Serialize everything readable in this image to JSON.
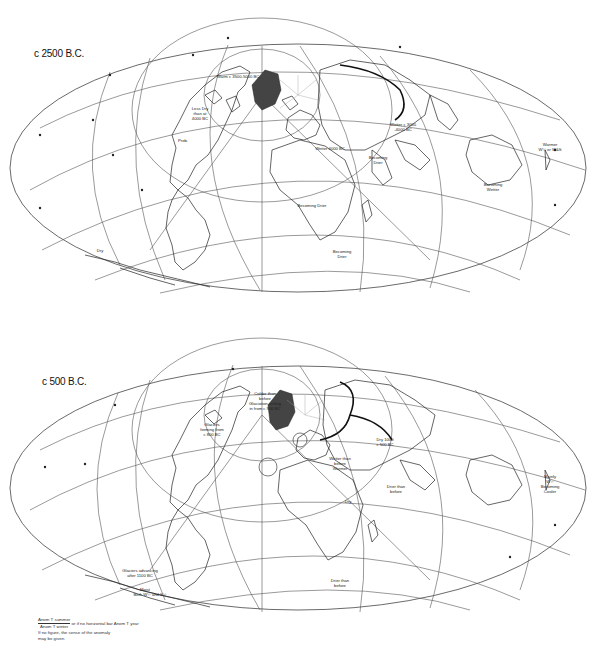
{
  "figure": {
    "type": "paleoclimate anomaly world maps",
    "projection": "oblique equal-area world projection centered on North Pole / Greenland"
  },
  "panels": [
    {
      "title": "c 2500 B.C.",
      "annotations": [
        {
          "text": "Warm c 3500-5000 BC",
          "region": "arctic-canada"
        },
        {
          "text": "Less Dry than at 4000 BC",
          "region": "north-america"
        },
        {
          "text": "Prob. dry",
          "region": "central-north-america"
        },
        {
          "text": "Wetter 4000 BC",
          "region": "scandinavia"
        },
        {
          "text": "Wetter c 3000-4000 BC",
          "region": "central-asia"
        },
        {
          "text": "Becoming Drier",
          "region": "india"
        },
        {
          "text": "Becoming Drier",
          "region": "sahara"
        },
        {
          "text": "Becoming Drier",
          "region": "east-africa"
        },
        {
          "text": "Becoming Wetter",
          "region": "northern-australia"
        },
        {
          "text": "Warmer W½ or W&S",
          "region": "new-zealand"
        },
        {
          "text": "Dry",
          "region": "south-america"
        }
      ]
    },
    {
      "title": "c 500 B.C.",
      "annotations": [
        {
          "text": "Colder than before Glaciation setting in from c 900 B.C.",
          "region": "alaska-arctic"
        },
        {
          "text": "Glaciers forming from c 800 B.C.",
          "region": "canada-rockies"
        },
        {
          "text": "Dry 1000 c 500 BC",
          "region": "central-asia"
        },
        {
          "text": "Wetter than before Warmer",
          "region": "europe"
        },
        {
          "text": "Drier than before",
          "region": "india"
        },
        {
          "text": "Dry",
          "region": "middle-east"
        },
        {
          "text": "Mainly W½ Becoming Cooler",
          "region": "new-zealand"
        },
        {
          "text": "Glaciers advancing after 1100 BC",
          "region": "south-america-andes"
        },
        {
          "text": "Moist Both W½ and S½",
          "region": "southern-south-america"
        },
        {
          "text": "Drier than before",
          "region": "southern-africa"
        }
      ]
    }
  ],
  "legend": {
    "line1_num": "Anom T summer",
    "line1_den": "Anom T winter",
    "line1_suffix": "or if no horizontal bar Anom T year",
    "line2": "If no figure, the sense of the anomaly",
    "line3": "may be given."
  }
}
